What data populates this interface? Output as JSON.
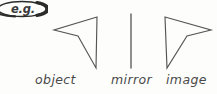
{
  "figure": {
    "background_color": "#fdfdfc",
    "stroke_color": "#555555",
    "text_color": "#4a4a4a"
  },
  "callout": {
    "text": "e.g.",
    "shape": "ellipse-outline",
    "stroke_color": "#2b2b2b"
  },
  "labels": {
    "object": "object",
    "mirror": "mirror",
    "image": "image"
  },
  "shapes": {
    "object_arrow": {
      "name": "object",
      "points": "97,17 54,30 78,36 96,68",
      "closed": true
    },
    "mirror_line": {
      "name": "mirror",
      "x1": 131,
      "y1": 14,
      "x2": 131,
      "y2": 68
    },
    "image_arrow": {
      "name": "image",
      "points": "165,17 211,30 187,36 167,68",
      "closed": true
    }
  }
}
